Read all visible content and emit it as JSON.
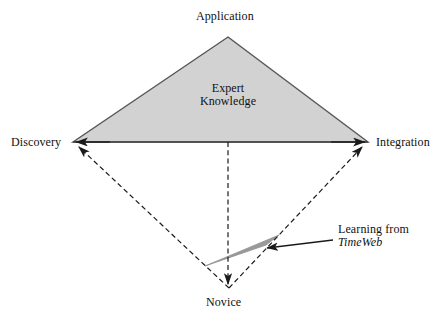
{
  "diagram": {
    "vertices": {
      "top": "Application",
      "left": "Discovery",
      "right": "Integration",
      "bottom": "Novice"
    },
    "region_label_line1": "Expert",
    "region_label_line2": "Knowledge",
    "annotation_line1": "Learning from",
    "annotation_line2": "TimeWeb",
    "colors": {
      "triangle_fill": "#d2d2d2",
      "triangle_stroke": "#555555",
      "wedge_fill": "#9a9a9a",
      "dashed_stroke": "#1a1a1a",
      "text": "#111111",
      "background": "#ffffff"
    },
    "geometry": {
      "apex_x": 228,
      "apex_y": 37,
      "left_x": 73,
      "left_y": 142,
      "right_x": 368,
      "right_y": 142,
      "bottom_x": 229,
      "bottom_y": 288
    }
  }
}
